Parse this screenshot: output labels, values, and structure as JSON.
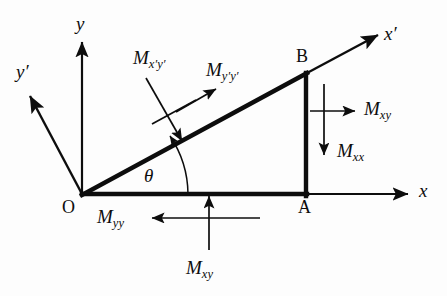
{
  "figure": {
    "name": "moment-resultants-on-triangular-element",
    "background_color": "#fdfdfd",
    "ink_color": "#0d0d0d"
  },
  "axes": [
    {
      "id": "y",
      "label": "y",
      "prime": false,
      "description": "vertical axis pointing up from origin"
    },
    {
      "id": "x",
      "label": "x",
      "prime": false,
      "description": "horizontal axis pointing right from origin"
    },
    {
      "id": "y-prime",
      "label": "y",
      "prime": true,
      "description": "rotated axis pointing up and to the left"
    },
    {
      "id": "x-prime",
      "label": "x",
      "prime": true,
      "description": "rotated axis along hypotenuse pointing up-right"
    }
  ],
  "points": [
    {
      "id": "O",
      "label": "O",
      "description": "origin at triangle lower-left vertex"
    },
    {
      "id": "A",
      "label": "A",
      "description": "triangle lower-right vertex on x axis"
    },
    {
      "id": "B",
      "label": "B",
      "description": "triangle upper-right vertex"
    }
  ],
  "angle": {
    "label": "θ",
    "description": "angle between x axis and hypotenuse OB"
  },
  "moments": [
    {
      "id": "m-xpyp",
      "base": "M",
      "sub": "x′y′",
      "sub_plain": "x'y'",
      "direction": "down-right, normal into hypotenuse",
      "position": "upper-left of hypotenuse midpoint"
    },
    {
      "id": "m-ypyp",
      "base": "M",
      "sub": "y′y′",
      "sub_plain": "y'y'",
      "direction": "up-right, along hypotenuse outward normal",
      "position": "above hypotenuse"
    },
    {
      "id": "m-xy-right",
      "base": "M",
      "sub": "xy",
      "sub_plain": "xy",
      "direction": "right, horizontal",
      "position": "right of edge AB"
    },
    {
      "id": "m-xx",
      "base": "M",
      "sub": "xx",
      "sub_plain": "xx",
      "direction": "down, vertical",
      "position": "right of edge AB, below M xy"
    },
    {
      "id": "m-yy",
      "base": "M",
      "sub": "yy",
      "sub_plain": "yy",
      "direction": "left, horizontal",
      "position": "below edge OA"
    },
    {
      "id": "m-xy-bottom",
      "base": "M",
      "sub": "xy",
      "sub_plain": "xy",
      "direction": "up, vertical",
      "position": "below edge OA, under the crossing point"
    }
  ]
}
